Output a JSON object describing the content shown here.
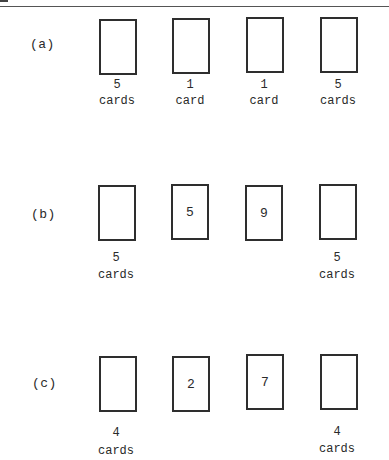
{
  "figure": {
    "rows": [
      {
        "label": "(a)",
        "cards": [
          {
            "face": "",
            "count": "5",
            "unit": "cards"
          },
          {
            "face": "",
            "count": "1",
            "unit": "card"
          },
          {
            "face": "",
            "count": "1",
            "unit": "card"
          },
          {
            "face": "",
            "count": "5",
            "unit": "cards"
          }
        ]
      },
      {
        "label": "(b)",
        "cards": [
          {
            "face": "",
            "count": "5",
            "unit": "cards"
          },
          {
            "face": "5",
            "count": "",
            "unit": ""
          },
          {
            "face": "9",
            "count": "",
            "unit": ""
          },
          {
            "face": "",
            "count": "5",
            "unit": "cards"
          }
        ]
      },
      {
        "label": "(c)",
        "cards": [
          {
            "face": "",
            "count": "4",
            "unit": "cards"
          },
          {
            "face": "2",
            "count": "",
            "unit": ""
          },
          {
            "face": "7",
            "count": "",
            "unit": ""
          },
          {
            "face": "",
            "count": "4",
            "unit": "cards"
          }
        ]
      }
    ]
  }
}
